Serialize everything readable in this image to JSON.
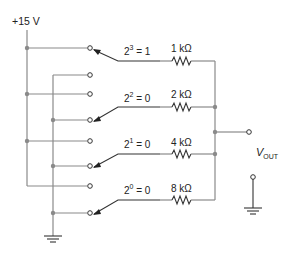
{
  "supply": {
    "label": "+15 V"
  },
  "switches": [
    {
      "bit": "3",
      "value": "1",
      "equals": "= 1",
      "resistor": "1 kΩ",
      "position": "+15V"
    },
    {
      "bit": "2",
      "value": "0",
      "equals": "= 0",
      "resistor": "2 kΩ",
      "position": "ground"
    },
    {
      "bit": "1",
      "value": "0",
      "equals": "= 0",
      "resistor": "4 kΩ",
      "position": "ground"
    },
    {
      "bit": "0",
      "value": "0",
      "equals": "= 0",
      "resistor": "8 kΩ",
      "position": "ground"
    }
  ],
  "output": {
    "label_main": "V",
    "label_sub": "OUT"
  },
  "colors": {
    "wire": "#8a8a8a",
    "component": "#333333",
    "background": "#ffffff"
  }
}
